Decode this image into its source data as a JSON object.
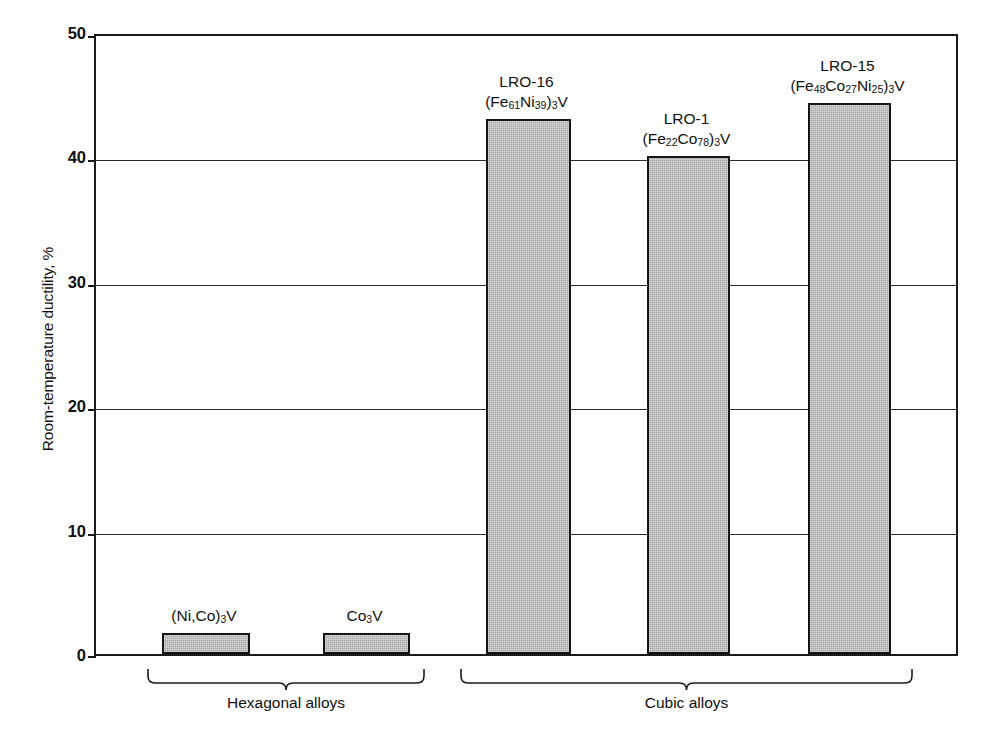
{
  "chart": {
    "type": "bar",
    "title": "",
    "ylabel": "Room-temperature ductility, %",
    "xlabel": "",
    "ylim": [
      0,
      50
    ],
    "yticks": [
      "0",
      "10",
      "20",
      "30",
      "40",
      "50"
    ],
    "grid": true,
    "legend": "none",
    "bar_fill_color": "#a9a9a9",
    "bar_edge_color": "#151515"
  },
  "chart_data": {
    "type": "bar",
    "title": "",
    "xlabel": "",
    "ylabel": "Room-temperature ductility, %",
    "ylim": [
      0,
      50
    ],
    "yticks": [
      0,
      10,
      20,
      30,
      40,
      50
    ],
    "grid": true,
    "legend_position": "none",
    "categories": [
      "(Ni,Co)3V",
      "Co3V",
      "LRO-16 (Fe61Ni39)3V",
      "LRO-1 (Fe22Co78)3V",
      "LRO-15 (Fe48Co27Ni25)3V"
    ],
    "values": [
      1.7,
      1.7,
      43.0,
      40.0,
      44.3
    ],
    "groups": [
      {
        "name": "Hexagonal alloys",
        "members": [
          "(Ni,Co)3V",
          "Co3V"
        ]
      },
      {
        "name": "Cubic alloys",
        "members": [
          "LRO-16 (Fe61Ni39)3V",
          "LRO-1 (Fe22Co78)3V",
          "LRO-15 (Fe48Co27Ni25)3V"
        ]
      }
    ]
  },
  "bars": [
    {
      "name": "ni-co-3v",
      "value": 1.7,
      "label_line1": "",
      "label_line2_parts": [
        {
          "t": "(Ni,Co)",
          "sub": false
        },
        {
          "t": "3",
          "sub": true
        },
        {
          "t": "V",
          "sub": false
        }
      ]
    },
    {
      "name": "co3v",
      "value": 1.7,
      "label_line1": "",
      "label_line2_parts": [
        {
          "t": "Co",
          "sub": false
        },
        {
          "t": "3",
          "sub": true
        },
        {
          "t": "V",
          "sub": false
        }
      ]
    },
    {
      "name": "lro-16",
      "value": 43.0,
      "label_line1": "LRO-16",
      "label_line2_parts": [
        {
          "t": "(Fe",
          "sub": false
        },
        {
          "t": "61",
          "sub": true
        },
        {
          "t": "Ni",
          "sub": false
        },
        {
          "t": "39",
          "sub": true
        },
        {
          "t": ")",
          "sub": false
        },
        {
          "t": "3",
          "sub": true
        },
        {
          "t": "V",
          "sub": false
        }
      ]
    },
    {
      "name": "lro-1",
      "value": 40.0,
      "label_line1": "LRO-1",
      "label_line2_parts": [
        {
          "t": "(Fe",
          "sub": false
        },
        {
          "t": "22",
          "sub": true
        },
        {
          "t": "Co",
          "sub": false
        },
        {
          "t": "78",
          "sub": true
        },
        {
          "t": ")",
          "sub": false
        },
        {
          "t": "3",
          "sub": true
        },
        {
          "t": "V",
          "sub": false
        }
      ]
    },
    {
      "name": "lro-15",
      "value": 44.3,
      "label_line1": "LRO-15",
      "label_line2_parts": [
        {
          "t": "(Fe",
          "sub": false
        },
        {
          "t": "48",
          "sub": true
        },
        {
          "t": "Co",
          "sub": false
        },
        {
          "t": "27",
          "sub": true
        },
        {
          "t": "Ni",
          "sub": false
        },
        {
          "t": "25",
          "sub": true
        },
        {
          "t": ")",
          "sub": false
        },
        {
          "t": "3",
          "sub": true
        },
        {
          "t": "V",
          "sub": false
        }
      ]
    }
  ],
  "groups": [
    {
      "name": "hexagonal-alloys",
      "label": "Hexagonal alloys"
    },
    {
      "name": "cubic-alloys",
      "label": "Cubic alloys"
    }
  ]
}
